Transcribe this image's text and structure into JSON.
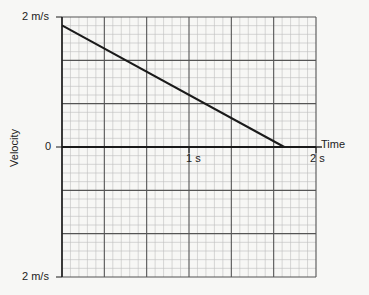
{
  "chart_data": {
    "type": "line",
    "title": "",
    "xlabel": "Time",
    "ylabel": "Velocity",
    "xlim": [
      0,
      2
    ],
    "ylim": [
      -2,
      2
    ],
    "x_ticks": [
      {
        "value": 1,
        "label": "1 s"
      },
      {
        "value": 2,
        "label": "2 s"
      }
    ],
    "y_ticks": [
      {
        "value": 2,
        "label": "2 m/s"
      },
      {
        "value": 0,
        "label": "0"
      },
      {
        "value": -2,
        "label": "2 m/s"
      }
    ],
    "grid": {
      "on": true,
      "major_x_step": 0.3333,
      "major_y_step": 0.6667,
      "minor_divisions": 5
    },
    "series": [
      {
        "name": "velocity",
        "x": [
          0,
          1.75
        ],
        "y": [
          1.87,
          0
        ],
        "color": "#1a1a1a"
      }
    ],
    "legend": null
  },
  "labels": {
    "y_top": "2 m/s",
    "y_zero": "0",
    "y_bottom": "2 m/s",
    "x_one": "1 s",
    "x_two": "2 s",
    "x_axis": "Time",
    "y_axis": "Velocity"
  }
}
